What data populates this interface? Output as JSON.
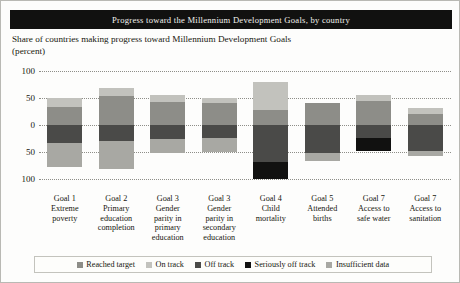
{
  "title": "Progress toward the Millennium Development Goals, by country",
  "subtitle": "Share of countries making progress toward Millennium Development Goals (percent)",
  "colors": {
    "reached_target": "#8d8d88",
    "on_track": "#c2c2bd",
    "off_track": "#4a4a48",
    "seriously_off_track": "#111110",
    "insufficient_data": "#a8a8a3",
    "banner": "#111110",
    "grid": "#8e8e88"
  },
  "legend": {
    "items": [
      {
        "label": "Reached target",
        "color": "#8d8d88"
      },
      {
        "label": "On track",
        "color": "#c2c2bd"
      },
      {
        "label": "Off track",
        "color": "#4a4a48"
      },
      {
        "label": "Seriously off track",
        "color": "#111110"
      },
      {
        "label": "Insufficient data",
        "color": "#a8a8a3"
      }
    ]
  },
  "chart_data": {
    "type": "bar",
    "title": "Progress toward the Millennium Development Goals, by country",
    "subtitle": "Share of countries making progress toward Millennium Development Goals (percent)",
    "xlabel": "",
    "ylabel": "Share of countries making progress toward Millennium Development Goals (percent)",
    "ylim": [
      -100,
      100
    ],
    "yticks": [
      100,
      50,
      0,
      -50,
      -100
    ],
    "ytick_labels": [
      "100",
      "50",
      "0",
      "50",
      "100"
    ],
    "grid": true,
    "stacked": true,
    "legend_position": "bottom",
    "note": "Positive stack = reached target / on track; negative stack = off track / seriously off track / insufficient data",
    "categories": [
      "Goal 1 Extreme poverty",
      "Goal 2 Primary education completion",
      "Goal 3 Gender parity in primary education",
      "Goal 3 Gender parity in secondary education",
      "Goal 4 Child mortality",
      "Goal 5 Attended births",
      "Goal 7 Access to safe water",
      "Goal 7 Access to sanitation"
    ],
    "category_lines": [
      [
        "Goal 1",
        "Extreme",
        "poverty"
      ],
      [
        "Goal 2",
        "Primary",
        "education",
        "completion"
      ],
      [
        "Goal 3",
        "Gender",
        "parity in",
        "primary",
        "education"
      ],
      [
        "Goal 3",
        "Gender",
        "parity in",
        "secondary",
        "education"
      ],
      [
        "Goal 4",
        "Child",
        "mortality"
      ],
      [
        "Goal 5",
        "Attended",
        "births"
      ],
      [
        "Goal 7",
        "Access to",
        "safe water"
      ],
      [
        "Goal 7",
        "Access to",
        "sanitation"
      ]
    ],
    "series": [
      {
        "name": "Reached target",
        "color": "#8d8d88",
        "values": [
          34,
          54,
          42,
          40,
          28,
          40,
          44,
          20
        ]
      },
      {
        "name": "On track",
        "color": "#c2c2bd",
        "values": [
          16,
          14,
          14,
          10,
          52,
          0,
          12,
          12
        ]
      },
      {
        "name": "Off track",
        "color": "#4a4a48",
        "values": [
          -34,
          -30,
          -26,
          -24,
          -68,
          -52,
          -24,
          -48
        ]
      },
      {
        "name": "Seriously off track",
        "color": "#111110",
        "values": [
          0,
          0,
          0,
          0,
          -32,
          0,
          -24,
          0
        ]
      },
      {
        "name": "Insufficient data",
        "color": "#a8a8a3",
        "values": [
          -44,
          -52,
          -26,
          -26,
          0,
          -14,
          0,
          -10
        ]
      }
    ]
  }
}
